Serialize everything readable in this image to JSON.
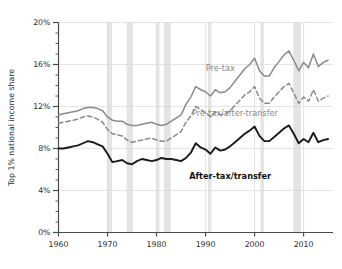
{
  "chart_data": {
    "type": "line",
    "title": "",
    "xlabel": "",
    "ylabel": "Top 1% national income share",
    "xlim": [
      1960,
      2016
    ],
    "ylim": [
      0,
      20
    ],
    "grid": true,
    "legend_position": "inline-annotations",
    "y_tick_labels": [
      "0%",
      "4%",
      "8%",
      "12%",
      "16%",
      "20%"
    ],
    "y_ticks": [
      0,
      4,
      8,
      12,
      16,
      20
    ],
    "y_minor_tick_step": 1,
    "x_tick_labels": [
      "1960",
      "1970",
      "1980",
      "1990",
      "2000",
      "2010"
    ],
    "x_ticks": [
      1960,
      1970,
      1980,
      1990,
      2000,
      2010
    ],
    "x": [
      1960,
      1961,
      1962,
      1963,
      1964,
      1965,
      1966,
      1967,
      1968,
      1969,
      1970,
      1971,
      1972,
      1973,
      1974,
      1975,
      1976,
      1977,
      1978,
      1979,
      1980,
      1981,
      1982,
      1983,
      1984,
      1985,
      1986,
      1987,
      1988,
      1989,
      1990,
      1991,
      1992,
      1993,
      1994,
      1995,
      1996,
      1997,
      1998,
      1999,
      2000,
      2001,
      2002,
      2003,
      2004,
      2005,
      2006,
      2007,
      2008,
      2009,
      2010,
      2011,
      2012,
      2013,
      2014,
      2015
    ],
    "series": [
      {
        "name": "Pre-tax",
        "color": "#8a8a8a",
        "style": "solid",
        "label_x": 1993,
        "label_y": 15.4,
        "values": [
          11.2,
          11.3,
          11.4,
          11.5,
          11.6,
          11.8,
          11.9,
          11.9,
          11.8,
          11.6,
          11.0,
          10.7,
          10.6,
          10.6,
          10.3,
          10.2,
          10.2,
          10.3,
          10.4,
          10.5,
          10.3,
          10.2,
          10.3,
          10.6,
          10.9,
          11.2,
          12.2,
          12.9,
          13.9,
          13.6,
          13.4,
          13.0,
          13.6,
          13.3,
          13.4,
          13.8,
          14.4,
          15.0,
          15.6,
          16.0,
          16.6,
          15.4,
          14.9,
          14.9,
          15.7,
          16.3,
          16.9,
          17.3,
          16.4,
          15.4,
          16.2,
          15.7,
          17.0,
          15.8,
          16.2,
          16.4
        ]
      },
      {
        "name": "Pre-tax/after-transfer",
        "color": "#8a8a8a",
        "style": "dashed",
        "label_x": 1996,
        "label_y": 11.1,
        "values": [
          10.4,
          10.5,
          10.6,
          10.7,
          10.8,
          11.0,
          11.1,
          11.0,
          10.8,
          10.5,
          9.8,
          9.4,
          9.3,
          9.2,
          8.8,
          8.6,
          8.7,
          8.8,
          8.9,
          9.0,
          8.8,
          8.7,
          8.7,
          9.0,
          9.3,
          9.6,
          10.5,
          11.1,
          12.0,
          11.7,
          11.4,
          11.0,
          11.5,
          11.2,
          11.3,
          11.6,
          12.1,
          12.6,
          13.1,
          13.4,
          13.9,
          12.8,
          12.3,
          12.3,
          12.9,
          13.4,
          13.9,
          14.2,
          13.3,
          12.3,
          12.9,
          12.5,
          13.6,
          12.5,
          12.8,
          13.0
        ]
      },
      {
        "name": "After-tax/transfer",
        "color": "#1a1a1a",
        "style": "solid",
        "label_x": 1995,
        "label_y": 5.1,
        "values": [
          8.0,
          8.0,
          8.1,
          8.2,
          8.3,
          8.5,
          8.7,
          8.6,
          8.4,
          8.2,
          7.5,
          6.7,
          6.8,
          6.9,
          6.6,
          6.5,
          6.8,
          7.0,
          6.9,
          6.8,
          6.9,
          7.1,
          7.0,
          7.0,
          6.9,
          6.8,
          7.1,
          7.6,
          8.5,
          8.1,
          7.9,
          7.5,
          8.1,
          7.8,
          7.9,
          8.2,
          8.6,
          9.0,
          9.4,
          9.7,
          10.1,
          9.2,
          8.7,
          8.7,
          9.1,
          9.5,
          9.9,
          10.2,
          9.4,
          8.5,
          8.9,
          8.6,
          9.5,
          8.6,
          8.8,
          8.9
        ]
      }
    ],
    "recession_bands": [
      {
        "start": 1969.9,
        "end": 1970.9
      },
      {
        "start": 1973.9,
        "end": 1975.2
      },
      {
        "start": 1980.0,
        "end": 1980.6
      },
      {
        "start": 1981.5,
        "end": 1982.9
      },
      {
        "start": 1990.5,
        "end": 1991.2
      },
      {
        "start": 2001.2,
        "end": 2001.9
      },
      {
        "start": 2007.9,
        "end": 2009.5
      }
    ]
  }
}
